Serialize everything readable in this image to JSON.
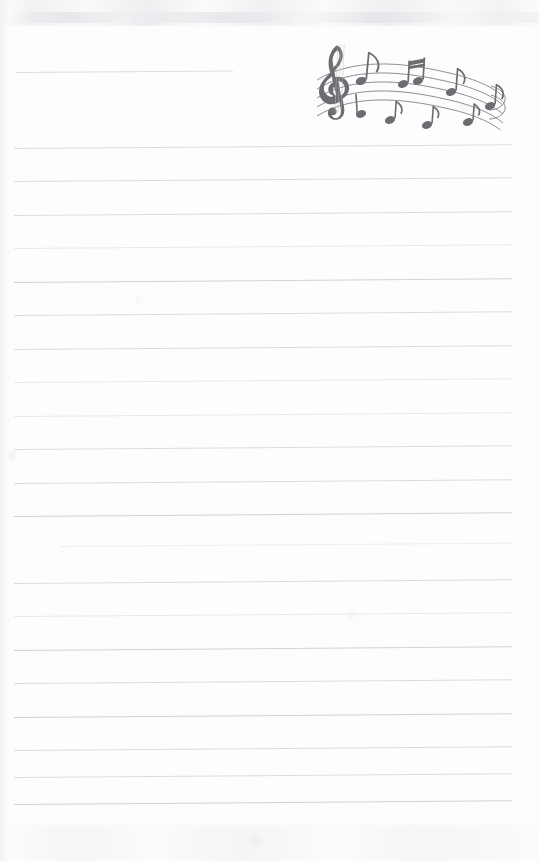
{
  "page": {
    "kind": "lined-notepaper-with-music-header",
    "width": 539,
    "height": 861,
    "paper_color": "#fdfdfd",
    "rule_color": "#dcdce0",
    "accent_color": "#6a6a72",
    "text_content": "",
    "title_line_placeholder": ""
  },
  "header": {
    "title_rule": {
      "label": "title-write-on-line",
      "x": 16,
      "y": 72,
      "width": 217,
      "color": "#dddde1"
    },
    "graphic": {
      "name": "music-staff-illustration",
      "description": "Treble clef with wavy five-line staff and eighth notes",
      "color": "#6a6a72",
      "clef": "treble-clef",
      "staff_lines": 5,
      "notes": [
        {
          "type": "eighth-note",
          "stem": "up"
        },
        {
          "type": "beamed-eighth-pair",
          "stem": "up"
        },
        {
          "type": "eighth-note",
          "stem": "down"
        },
        {
          "type": "eighth-note",
          "stem": "up"
        },
        {
          "type": "eighth-note",
          "stem": "down"
        },
        {
          "type": "beamed-eighth-pair",
          "stem": "down"
        },
        {
          "type": "eighth-note",
          "stem": "up"
        },
        {
          "type": "eighth-note",
          "stem": "down"
        }
      ]
    }
  },
  "body": {
    "name": "ruled-writing-area",
    "line_count": 21,
    "first_line_y": 148,
    "line_spacing": 33.5,
    "line_left": 14,
    "line_right": 512,
    "skew_deg": -0.42,
    "lines": [
      {
        "y": 148,
        "left": 14,
        "right": 512,
        "weight": "normal"
      },
      {
        "y": 181,
        "left": 14,
        "right": 512,
        "weight": "normal"
      },
      {
        "y": 215,
        "left": 14,
        "right": 512,
        "weight": "normal"
      },
      {
        "y": 248,
        "left": 14,
        "right": 512,
        "weight": "faint"
      },
      {
        "y": 282,
        "left": 14,
        "right": 512,
        "weight": "strong"
      },
      {
        "y": 315,
        "left": 14,
        "right": 512,
        "weight": "normal"
      },
      {
        "y": 349,
        "left": 14,
        "right": 512,
        "weight": "normal"
      },
      {
        "y": 382,
        "left": 14,
        "right": 512,
        "weight": "faint"
      },
      {
        "y": 416,
        "left": 14,
        "right": 512,
        "weight": "faint"
      },
      {
        "y": 449,
        "left": 14,
        "right": 512,
        "weight": "normal"
      },
      {
        "y": 483,
        "left": 14,
        "right": 512,
        "weight": "normal"
      },
      {
        "y": 516,
        "left": 14,
        "right": 512,
        "weight": "strong"
      },
      {
        "y": 546,
        "left": 60,
        "right": 512,
        "weight": "fainter"
      },
      {
        "y": 583,
        "left": 14,
        "right": 512,
        "weight": "normal"
      },
      {
        "y": 616,
        "left": 14,
        "right": 512,
        "weight": "faint"
      },
      {
        "y": 650,
        "left": 14,
        "right": 512,
        "weight": "strong"
      },
      {
        "y": 683,
        "left": 14,
        "right": 512,
        "weight": "normal"
      },
      {
        "y": 717,
        "left": 14,
        "right": 512,
        "weight": "strong"
      },
      {
        "y": 750,
        "left": 14,
        "right": 512,
        "weight": "normal"
      },
      {
        "y": 777,
        "left": 14,
        "right": 512,
        "weight": "normal"
      },
      {
        "y": 804,
        "left": 14,
        "right": 512,
        "weight": "strong"
      }
    ]
  },
  "artifacts": {
    "top_smudge": true,
    "bottom_smudge": true,
    "left_edge_shadow": true,
    "blotches": [
      {
        "x": 460,
        "y": 104,
        "size": 7
      },
      {
        "x": 348,
        "y": 612,
        "size": 6
      },
      {
        "x": 252,
        "y": 836,
        "size": 9
      },
      {
        "x": 136,
        "y": 298,
        "size": 5
      },
      {
        "x": 8,
        "y": 452,
        "size": 8
      }
    ]
  }
}
